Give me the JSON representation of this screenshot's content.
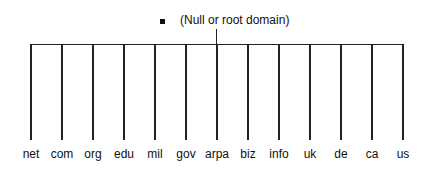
{
  "diagram": {
    "type": "tree",
    "root": {
      "label": "(Null or root domain)",
      "marker": "square-bullet"
    },
    "children": [
      {
        "label": "net",
        "x": 31
      },
      {
        "label": "com",
        "x": 62
      },
      {
        "label": "org",
        "x": 93
      },
      {
        "label": "edu",
        "x": 124
      },
      {
        "label": "mil",
        "x": 155
      },
      {
        "label": "gov",
        "x": 186
      },
      {
        "label": "arpa",
        "x": 217
      },
      {
        "label": "biz",
        "x": 248
      },
      {
        "label": "info",
        "x": 279
      },
      {
        "label": "uk",
        "x": 310
      },
      {
        "label": "de",
        "x": 341
      },
      {
        "label": "ca",
        "x": 372
      },
      {
        "label": "us",
        "x": 403
      }
    ],
    "colors": {
      "line": "#222222",
      "text": "#111111",
      "background": "#ffffff"
    }
  }
}
